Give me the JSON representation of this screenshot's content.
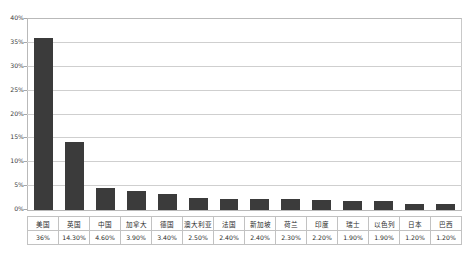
{
  "chart_data": {
    "type": "bar",
    "title": "",
    "subtitle": "",
    "xlabel": "",
    "ylabel": "",
    "ylim": [
      0,
      40
    ],
    "ytick_step": 5,
    "grid": true,
    "legend": "none",
    "bar_color": "#3b3b3b",
    "plot_background": "#ffffff",
    "gridline_color": "#cfcfcf",
    "categories": [
      "美国",
      "英国",
      "中国",
      "加拿大",
      "德国",
      "澳大利亚",
      "法国",
      "新加坡",
      "荷兰",
      "印度",
      "瑞士",
      "以色列",
      "日本",
      "巴西"
    ],
    "values": [
      36.0,
      14.3,
      4.6,
      3.9,
      3.4,
      2.5,
      2.4,
      2.4,
      2.3,
      2.2,
      1.9,
      1.9,
      1.2,
      1.2
    ],
    "value_labels": [
      "36%",
      "14.30%",
      "4.60%",
      "3.90%",
      "3.40%",
      "2.50%",
      "2.40%",
      "2.40%",
      "2.30%",
      "2.20%",
      "1.90%",
      "1.90%",
      "1.20%",
      "1.20%"
    ],
    "ytick_labels": [
      "40%",
      "35%",
      "30%",
      "25%",
      "20%",
      "15%",
      "10%",
      "5%",
      "0%"
    ],
    "ytick_values": [
      40,
      35,
      30,
      25,
      20,
      15,
      10,
      5,
      0
    ]
  }
}
